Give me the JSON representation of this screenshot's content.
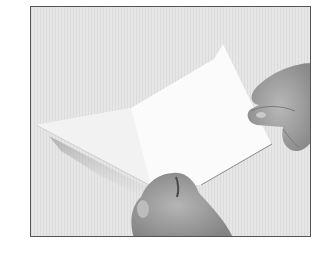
{
  "image": {
    "description": "Grayscale photograph of two hands folding a white sheet of paper against a light striped background",
    "alt": "Hands folding a sheet of paper",
    "colors": {
      "page_background": "#ffffff",
      "photo_background": "#e4e4e4",
      "border": "#555555",
      "paper": "#fbfbfb",
      "skin_light": "#b4b4b4",
      "skin_dark": "#7a7a7a"
    }
  }
}
